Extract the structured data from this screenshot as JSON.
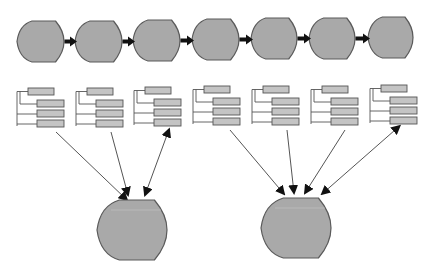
{
  "diagram": {
    "colors": {
      "shape_fill": "#a9a9a9",
      "shape_stroke": "#5a5a5a",
      "box_fill": "#c4c4c4",
      "box_stroke": "#555555",
      "line": "#555555",
      "arrow": "#111111",
      "background": "#ffffff"
    },
    "top_row": {
      "shape_count": 7,
      "connector": "right-arrow-icon",
      "shapes": [
        {
          "id": "stage-1",
          "x": 17,
          "y": 21,
          "w": 47,
          "h": 41
        },
        {
          "id": "stage-2",
          "x": 75,
          "y": 21,
          "w": 47,
          "h": 41
        },
        {
          "id": "stage-3",
          "x": 133,
          "y": 20,
          "w": 47,
          "h": 41
        },
        {
          "id": "stage-4",
          "x": 192,
          "y": 19,
          "w": 47,
          "h": 41
        },
        {
          "id": "stage-5",
          "x": 251,
          "y": 18,
          "w": 46,
          "h": 41
        },
        {
          "id": "stage-6",
          "x": 309,
          "y": 18,
          "w": 46,
          "h": 41
        },
        {
          "id": "stage-7",
          "x": 368,
          "y": 17,
          "w": 45,
          "h": 41
        }
      ]
    },
    "trees": [
      {
        "id": "tree-1",
        "x": 16,
        "y": 88
      },
      {
        "id": "tree-2",
        "x": 75,
        "y": 88
      },
      {
        "id": "tree-3",
        "x": 133,
        "y": 87
      },
      {
        "id": "tree-4",
        "x": 192,
        "y": 86
      },
      {
        "id": "tree-5",
        "x": 251,
        "y": 86
      },
      {
        "id": "tree-6",
        "x": 310,
        "y": 86
      },
      {
        "id": "tree-7",
        "x": 369,
        "y": 85
      }
    ],
    "merged_shapes": [
      {
        "id": "merged-left",
        "x": 97,
        "y": 200,
        "w": 70,
        "h": 60,
        "sources": [
          "tree-1",
          "tree-2",
          "tree-3"
        ]
      },
      {
        "id": "merged-right",
        "x": 261,
        "y": 198,
        "w": 70,
        "h": 60,
        "sources": [
          "tree-4",
          "tree-5",
          "tree-6",
          "tree-7"
        ]
      }
    ],
    "edges": [
      {
        "from": "tree-1",
        "to": "merged-left",
        "x1": 56,
        "y1": 132,
        "x2": 127,
        "y2": 200,
        "style": "single"
      },
      {
        "from": "tree-2",
        "to": "merged-left",
        "x1": 111,
        "y1": 132,
        "x2": 128,
        "y2": 195,
        "style": "single"
      },
      {
        "from": "tree-3",
        "to": "merged-left",
        "x1": 167,
        "y1": 135,
        "x2": 145,
        "y2": 195,
        "style": "double"
      },
      {
        "from": "tree-4",
        "to": "merged-right",
        "x1": 230,
        "y1": 130,
        "x2": 284,
        "y2": 194,
        "style": "single"
      },
      {
        "from": "tree-5",
        "to": "merged-right",
        "x1": 287,
        "y1": 130,
        "x2": 294,
        "y2": 193,
        "style": "single"
      },
      {
        "from": "tree-6",
        "to": "merged-right",
        "x1": 345,
        "y1": 130,
        "x2": 305,
        "y2": 193,
        "style": "single"
      },
      {
        "from": "tree-7",
        "to": "merged-right",
        "x1": 395,
        "y1": 130,
        "x2": 322,
        "y2": 194,
        "style": "double"
      }
    ],
    "caption_fragment": ""
  }
}
